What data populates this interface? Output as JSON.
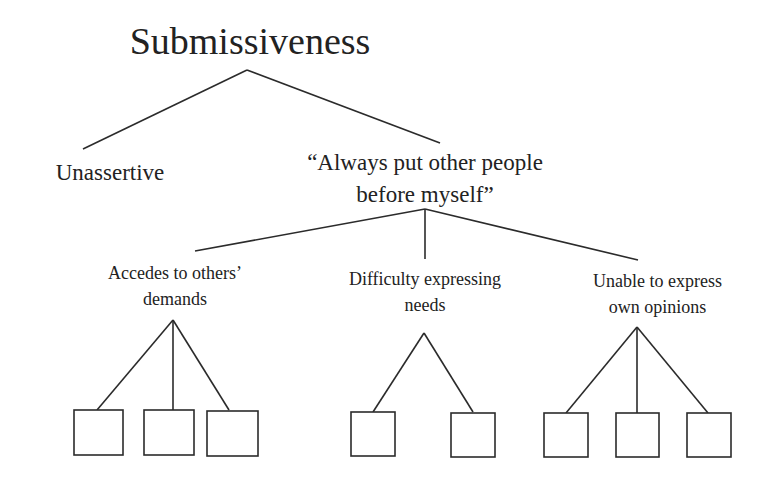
{
  "diagram": {
    "type": "tree",
    "root": {
      "label": "Submissiveness"
    },
    "level1": [
      {
        "id": "unassertive",
        "label": "Unassertive"
      },
      {
        "id": "belief",
        "label_line1": "“Always put other people",
        "label_line2": "before myself”"
      }
    ],
    "level2": [
      {
        "id": "accedes",
        "label_line1": "Accedes to others’",
        "label_line2": "demands",
        "leaf_count": 3
      },
      {
        "id": "difficulty",
        "label_line1": "Difficulty expressing",
        "label_line2": "needs",
        "leaf_count": 2
      },
      {
        "id": "unable",
        "label_line1": "Unable to express",
        "label_line2": "own opinions",
        "leaf_count": 3
      }
    ],
    "leaves": {
      "note": "Empty boxes",
      "total": 8
    },
    "colors": {
      "line": "#2b2b2b",
      "text": "#222222",
      "background": "#ffffff"
    }
  }
}
